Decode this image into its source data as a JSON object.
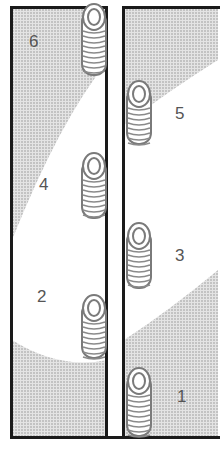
{
  "figure": {
    "colors": {
      "border": "#1a1a1a",
      "shade": "#c8c8c8",
      "coin_outline": "#7a7a7a",
      "label": "#555555"
    },
    "left_column": {
      "labels": [
        {
          "text": "6",
          "x": 30,
          "y": 33
        },
        {
          "text": "4",
          "x": 40,
          "y": 176
        },
        {
          "text": "2",
          "x": 38,
          "y": 288
        }
      ]
    },
    "right_column": {
      "labels": [
        {
          "text": "5",
          "x": 176,
          "y": 105
        },
        {
          "text": "3",
          "x": 176,
          "y": 247
        },
        {
          "text": "1",
          "x": 178,
          "y": 388
        }
      ]
    },
    "coin_stacks": [
      {
        "name": "stack-6",
        "x": 82,
        "y": 3,
        "height": 78
      },
      {
        "name": "stack-5",
        "x": 127,
        "y": 80,
        "height": 70
      },
      {
        "name": "stack-4",
        "x": 82,
        "y": 152,
        "height": 72
      },
      {
        "name": "stack-3",
        "x": 127,
        "y": 222,
        "height": 72
      },
      {
        "name": "stack-2",
        "x": 82,
        "y": 294,
        "height": 70
      },
      {
        "name": "stack-1",
        "x": 127,
        "y": 367,
        "height": 75
      }
    ]
  }
}
